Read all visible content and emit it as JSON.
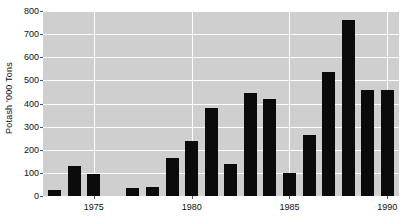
{
  "chart_data": {
    "type": "bar",
    "title": "",
    "xlabel": "",
    "ylabel": "Potash '000 Tons",
    "ylim": [
      0,
      800
    ],
    "xlim": [
      1972.4,
      1990.6
    ],
    "yticks": [
      0,
      100,
      200,
      300,
      400,
      500,
      600,
      700,
      800
    ],
    "ytick_labels": [
      "0",
      "100",
      "200",
      "300",
      "400",
      "500",
      "600",
      "700",
      "800"
    ],
    "xticks": [
      1975,
      1980,
      1985,
      1990
    ],
    "xtick_labels": [
      "1975",
      "1980",
      "1985",
      "1990"
    ],
    "grid": "horizontal-and-vertical-white-on-gray",
    "legend": "none",
    "bar_color": "#0b0b0b",
    "plot_background": "#cfcfcf",
    "categories": [
      1973,
      1974,
      1975,
      1977,
      1978,
      1979,
      1980,
      1981,
      1982,
      1983,
      1984,
      1985,
      1986,
      1987,
      1988,
      1989,
      1990
    ],
    "values": [
      25,
      130,
      95,
      35,
      40,
      165,
      240,
      380,
      140,
      445,
      420,
      100,
      265,
      535,
      760,
      460,
      460
    ],
    "bars": [
      {
        "x": 1973,
        "value": 25
      },
      {
        "x": 1974,
        "value": 130
      },
      {
        "x": 1975,
        "value": 95
      },
      {
        "x": 1977,
        "value": 35
      },
      {
        "x": 1978,
        "value": 40
      },
      {
        "x": 1979,
        "value": 165
      },
      {
        "x": 1980,
        "value": 240
      },
      {
        "x": 1981,
        "value": 380
      },
      {
        "x": 1982,
        "value": 140
      },
      {
        "x": 1983,
        "value": 445
      },
      {
        "x": 1984,
        "value": 420
      },
      {
        "x": 1985,
        "value": 100
      },
      {
        "x": 1986,
        "value": 265
      },
      {
        "x": 1987,
        "value": 535
      },
      {
        "x": 1988,
        "value": 760
      },
      {
        "x": 1989,
        "value": 460
      },
      {
        "x": 1990,
        "value": 460
      }
    ],
    "missing_years": [
      1976
    ]
  }
}
